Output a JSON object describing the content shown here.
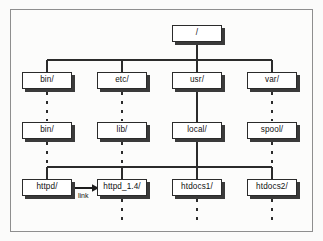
{
  "figure": {
    "frame": {
      "border_color": "#8e8e8e",
      "background": "#fcfcfb"
    },
    "node_style": {
      "fill": "#ffffff",
      "border_color": "#2b2b2b",
      "shadow_color": "#3a3a3a"
    },
    "connector_color": "#2b2b2b"
  },
  "nodes": {
    "root": {
      "label": "/",
      "x": 172,
      "y": 25,
      "w": 50,
      "h": 17
    },
    "bin": {
      "label": "bin/",
      "x": 22,
      "y": 72,
      "w": 50,
      "h": 17
    },
    "etc": {
      "label": "etc/",
      "x": 97,
      "y": 72,
      "w": 50,
      "h": 17
    },
    "usr": {
      "label": "usr/",
      "x": 172,
      "y": 72,
      "w": 50,
      "h": 17
    },
    "var": {
      "label": "var/",
      "x": 247,
      "y": 72,
      "w": 50,
      "h": 17
    },
    "bin2": {
      "label": "bin/",
      "x": 22,
      "y": 122,
      "w": 50,
      "h": 17
    },
    "lib": {
      "label": "lib/",
      "x": 97,
      "y": 122,
      "w": 50,
      "h": 17
    },
    "local": {
      "label": "local/",
      "x": 172,
      "y": 122,
      "w": 50,
      "h": 17
    },
    "spool": {
      "label": "spool/",
      "x": 247,
      "y": 122,
      "w": 50,
      "h": 17
    },
    "httpd": {
      "label": "httpd/",
      "x": 22,
      "y": 179,
      "w": 50,
      "h": 17
    },
    "httpd14": {
      "label": "httpd_1.4/",
      "x": 97,
      "y": 179,
      "w": 50,
      "h": 17
    },
    "htdocs1": {
      "label": "htdocs1/",
      "x": 172,
      "y": 179,
      "w": 50,
      "h": 17
    },
    "htdocs2": {
      "label": "htdocs2/",
      "x": 247,
      "y": 179,
      "w": 50,
      "h": 17
    }
  },
  "annotations": {
    "link": {
      "label": "link",
      "x": 78,
      "y": 192
    }
  },
  "tree_data": {
    "type": "tree",
    "root": "/",
    "levels": [
      [
        "/"
      ],
      [
        "bin/",
        "etc/",
        "usr/",
        "var/"
      ],
      [
        "bin/",
        "lib/",
        "local/",
        "spool/"
      ],
      [
        "httpd/",
        "httpd_1.4/",
        "htdocs1/",
        "htdocs2/"
      ]
    ],
    "edges": [
      {
        "from": "/",
        "to": "bin/",
        "style": "solid"
      },
      {
        "from": "/",
        "to": "etc/",
        "style": "solid"
      },
      {
        "from": "/",
        "to": "usr/",
        "style": "solid"
      },
      {
        "from": "/",
        "to": "var/",
        "style": "solid"
      },
      {
        "from": "bin/",
        "to": "bin/",
        "style": "dotted"
      },
      {
        "from": "etc/",
        "to": "lib/",
        "style": "dotted"
      },
      {
        "from": "usr/",
        "to": "local/",
        "style": "solid"
      },
      {
        "from": "var/",
        "to": "spool/",
        "style": "dotted"
      },
      {
        "from": "bin/",
        "to": "httpd/",
        "style": "dotted"
      },
      {
        "from": "lib/",
        "to": "httpd_1.4/",
        "style": "dotted"
      },
      {
        "from": "local/",
        "to": "httpd/",
        "style": "solid"
      },
      {
        "from": "local/",
        "to": "httpd_1.4/",
        "style": "solid"
      },
      {
        "from": "local/",
        "to": "htdocs1/",
        "style": "solid"
      },
      {
        "from": "local/",
        "to": "htdocs2/",
        "style": "solid"
      },
      {
        "from": "httpd/",
        "to": "httpd_1.4/",
        "style": "arrow",
        "label": "link"
      }
    ],
    "leaf_continuations": [
      "httpd_1.4/",
      "htdocs1/",
      "htdocs2/"
    ]
  }
}
